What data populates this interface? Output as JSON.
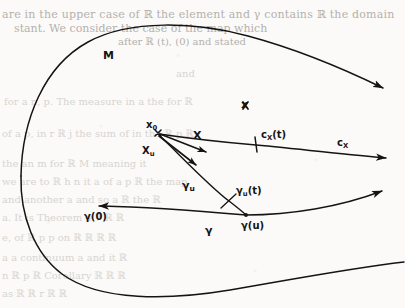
{
  "figure": {
    "type": "differential-geometry-diagram",
    "background_color": "#fbfaf8",
    "ink_color": "#141414"
  },
  "labels": {
    "manifold": "M",
    "point_x0": "x",
    "point_x0_sub": "0",
    "point_x": "x",
    "vector_X": "X",
    "vector_Xu": "X",
    "vector_Xu_sub": "u",
    "curve_cX_t": "c",
    "curve_cX_t_sub": "X",
    "curve_cX_t_arg": "(t)",
    "curve_cX": "c",
    "curve_cX_sub": "X",
    "curve_gamma_u": "γ",
    "curve_gamma_u_sub": "u",
    "curve_gamma_u_t": "γ",
    "curve_gamma_u_t_sub": "u",
    "curve_gamma_u_t_arg": "(t)",
    "curve_gamma": "γ",
    "gamma_0": "γ",
    "gamma_0_arg": "(0)",
    "gamma_u": "γ",
    "gamma_u_arg": "(u)"
  },
  "bleed_through": {
    "lines": [
      "are in the upper case of ℝ the element and γ contains ℝ the domain",
      "stant. We consider the case of the map which",
      "after ℝ (t), (0) and stated",
      "and",
      "for a n, p. The measure in a the for ℝ",
      "of a p, in r ℝ j the sum of in the ℝ p ℝ",
      "the an m for ℝ M meaning it",
      "we are to ℝ h n it a of a p ℝ the map",
      "and another a and so a ℝ the ℝ",
      "a. It is Theorem 4.7 ℝ ℝ",
      "e, of ℝ p p on ℝ ℝ ℝ ℝ",
      "a a continuum a and it ℝ",
      "n ℝ p ℝ Corollary ℝ ℝ ℝ",
      "as ℝ ℝ r ℝ ℝ"
    ]
  },
  "geometry": {
    "x0": [
      158,
      133
    ],
    "x_point": [
      245,
      105
    ],
    "cX_tick": [
      256,
      145
    ],
    "gamma_u_tick": [
      229,
      201
    ],
    "gamma_0_point": [
      97,
      206
    ],
    "gamma_u_point": [
      246,
      215
    ],
    "cX_arrow_end": [
      391,
      159
    ],
    "gamma_arrow_end": [
      387,
      192
    ],
    "manifold_arrow_end": [
      386,
      90
    ]
  }
}
